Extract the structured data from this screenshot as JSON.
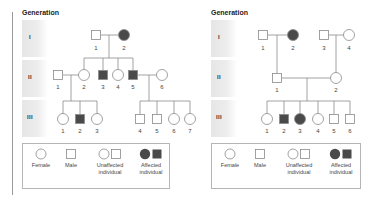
{
  "colors": {
    "affected": "#4a4a4a",
    "unaffected_fill": "#ffffff",
    "line": "#8a8a8a",
    "band": "#e6e6e6"
  },
  "left_pedigree": {
    "title": "Generation",
    "generations": [
      "I",
      "II",
      "III"
    ],
    "individuals": {
      "I": [
        {
          "id": "1",
          "sex": "male",
          "affected": false
        },
        {
          "id": "2",
          "sex": "female",
          "affected": true
        }
      ],
      "II": [
        {
          "id": "1",
          "sex": "male",
          "affected": false
        },
        {
          "id": "2",
          "sex": "female",
          "affected": false
        },
        {
          "id": "3",
          "sex": "male",
          "affected": true
        },
        {
          "id": "4",
          "sex": "female",
          "affected": false
        },
        {
          "id": "5",
          "sex": "male",
          "affected": true
        },
        {
          "id": "6",
          "sex": "female",
          "affected": false
        }
      ],
      "III": [
        {
          "id": "1",
          "sex": "female",
          "affected": false
        },
        {
          "id": "2",
          "sex": "male",
          "affected": true
        },
        {
          "id": "3",
          "sex": "female",
          "affected": false
        },
        {
          "id": "4",
          "sex": "male",
          "affected": false
        },
        {
          "id": "5",
          "sex": "male",
          "affected": false
        },
        {
          "id": "6",
          "sex": "female",
          "affected": false
        },
        {
          "id": "7",
          "sex": "female",
          "affected": false
        }
      ]
    },
    "legend": {
      "female": "Female",
      "male": "Male",
      "unaffected_1": "Unaffected",
      "unaffected_2": "individual",
      "affected_1": "Affected",
      "affected_2": "individual"
    }
  },
  "right_pedigree": {
    "title": "Generation",
    "generations": [
      "I",
      "II",
      "III"
    ],
    "individuals": {
      "I": [
        {
          "id": "1",
          "sex": "male",
          "affected": false
        },
        {
          "id": "2",
          "sex": "female",
          "affected": true
        },
        {
          "id": "3",
          "sex": "male",
          "affected": false
        },
        {
          "id": "4",
          "sex": "female",
          "affected": false
        }
      ],
      "II": [
        {
          "id": "1",
          "sex": "male",
          "affected": false
        },
        {
          "id": "2",
          "sex": "female",
          "affected": false
        }
      ],
      "III": [
        {
          "id": "1",
          "sex": "female",
          "affected": false
        },
        {
          "id": "2",
          "sex": "male",
          "affected": true
        },
        {
          "id": "3",
          "sex": "female",
          "affected": true
        },
        {
          "id": "4",
          "sex": "female",
          "affected": false
        },
        {
          "id": "5",
          "sex": "male",
          "affected": false
        },
        {
          "id": "6",
          "sex": "male",
          "affected": false
        }
      ]
    },
    "legend": {
      "female": "Female",
      "male": "Male",
      "unaffected_1": "Unaffected",
      "unaffected_2": "individual",
      "affected_1": "Affected",
      "affected_2": "individual"
    }
  },
  "labels": {
    "n1": "1",
    "n2": "2",
    "n3": "3",
    "n4": "4",
    "n5": "5",
    "n6": "6",
    "n7": "7"
  }
}
